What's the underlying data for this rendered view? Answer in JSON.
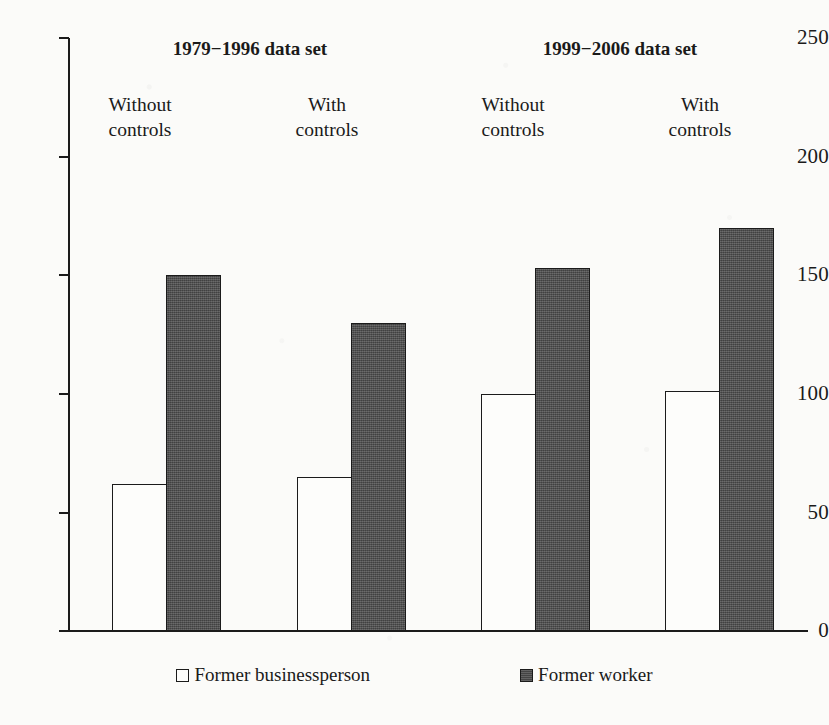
{
  "chart_data": {
    "type": "bar",
    "title": "",
    "xlabel": "",
    "ylabel": "",
    "ylim": [
      0,
      250
    ],
    "y_ticks": [
      0,
      50,
      100,
      150,
      200,
      250
    ],
    "y_tick_labels": [
      "0",
      "50",
      "100",
      "150",
      "200",
      "250"
    ],
    "grid": false,
    "legend_position": "bottom",
    "panel_titles": [
      "1979−1996 data set",
      "1999−2006 data set"
    ],
    "categories": [
      "Without controls",
      "With controls",
      "Without controls",
      "With controls"
    ],
    "category_lines": [
      [
        "Without",
        "controls"
      ],
      [
        "With",
        "controls"
      ],
      [
        "Without",
        "controls"
      ],
      [
        "With",
        "controls"
      ]
    ],
    "series": [
      {
        "name": "Former businessperson",
        "color": "#fdfdfb",
        "values": [
          62,
          65,
          100,
          101
        ]
      },
      {
        "name": "Former worker",
        "color": "#4d4d4d",
        "values": [
          150,
          130,
          153,
          170
        ]
      }
    ],
    "legend": [
      {
        "label": "Former businessperson",
        "swatch": "light"
      },
      {
        "label": "Former worker",
        "swatch": "dark"
      }
    ]
  },
  "axis": {
    "tick_0": "0",
    "tick_50": "50",
    "tick_100": "100",
    "tick_150": "150",
    "tick_200": "200",
    "tick_250": "250"
  },
  "panels": {
    "left_title": "1979−1996 data set",
    "right_title": "1999−2006 data set"
  },
  "groups": [
    {
      "line1": "Without",
      "line2": "controls"
    },
    {
      "line1": "With",
      "line2": "controls"
    },
    {
      "line1": "Without",
      "line2": "controls"
    },
    {
      "line1": "With",
      "line2": "controls"
    }
  ],
  "legend": {
    "item1": "Former businessperson",
    "item2": "Former worker"
  },
  "colors": {
    "ink": "#1b1b1b",
    "bar_light": "#fdfdfb",
    "bar_dark": "#4d4d4d",
    "background": "#fbfbf9"
  }
}
